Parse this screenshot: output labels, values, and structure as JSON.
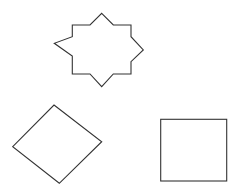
{
  "canvas": {
    "background": "#ffffff"
  },
  "shapes": [
    {
      "id": "star",
      "kind": "eight-pointed-star",
      "stroke": "#333333",
      "fill": "#ffffff"
    },
    {
      "id": "rhombus",
      "kind": "tilted-square",
      "stroke": "#333333",
      "fill": "#ffffff"
    },
    {
      "id": "square",
      "kind": "square",
      "stroke": "#333333",
      "fill": "#ffffff"
    }
  ]
}
